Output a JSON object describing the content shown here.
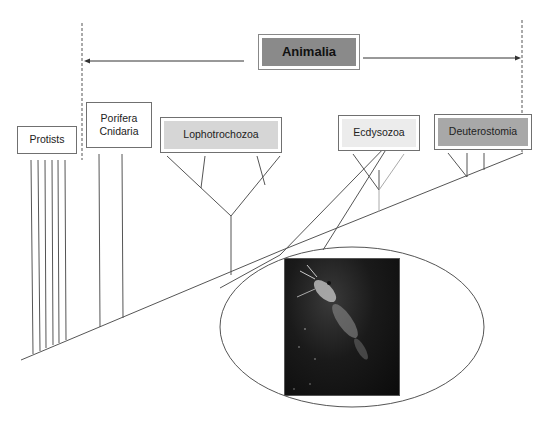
{
  "title": "Animalia",
  "groups": {
    "protists": "Protists",
    "porifera": "Porifera",
    "cnidaria": "Cnidaria",
    "lophotrochozoa": "Lophotrochozoa",
    "ecdysozoa": "Ecdysozoa",
    "deuterostomia": "Deuterostomia"
  },
  "colors": {
    "animalia_fill": "#8a8a8a",
    "lophotrochozoa_fill": "#d6d6d6",
    "ecdysozoa_fill": "#ececec",
    "deuterostomia_fill": "#a8a8a8",
    "line": "#555555"
  },
  "photo": {
    "subject": "krill-shrimp-photo"
  }
}
